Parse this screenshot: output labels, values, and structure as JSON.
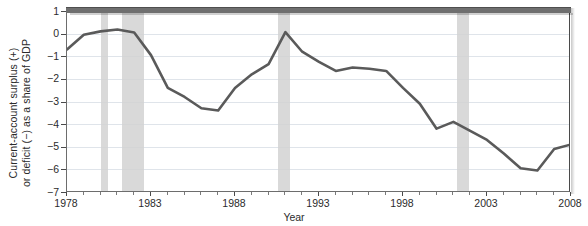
{
  "chart_data": {
    "type": "line",
    "title": "",
    "xlabel": "Year",
    "ylabel_line1": "Current-account surplus (+)",
    "ylabel_line2": "or deficit (−) as a share of GDP",
    "xlim": [
      1978,
      2008
    ],
    "ylim": [
      -7,
      1
    ],
    "ytick_labels": [
      "1",
      "0",
      "−1",
      "−2",
      "−3",
      "−4",
      "−5",
      "−6",
      "−7"
    ],
    "ytick_values": [
      1,
      0,
      -1,
      -2,
      -3,
      -4,
      -5,
      -6,
      -7
    ],
    "xtick_labels": [
      "1978",
      "1983",
      "1988",
      "1993",
      "1998",
      "2003",
      "2008"
    ],
    "xtick_values": [
      1978,
      1983,
      1988,
      1993,
      1998,
      2003,
      2008
    ],
    "grid": "horizontal",
    "legend": "none",
    "line_color": "#5a5a5a",
    "line_width": 2.6,
    "recession_band_color": "#d2d2d2",
    "gridline_color": "#dfe4ea",
    "axis_color": "#4a4a4a",
    "x": [
      1978,
      1979,
      1980,
      1981,
      1982,
      1983,
      1984,
      1985,
      1986,
      1987,
      1988,
      1989,
      1990,
      1991,
      1992,
      1993,
      1994,
      1995,
      1996,
      1997,
      1998,
      1999,
      2000,
      2001,
      2002,
      2003,
      2004,
      2005,
      2006,
      2007,
      2008
    ],
    "values": [
      -0.7,
      -0.05,
      0.1,
      0.18,
      0.05,
      -0.95,
      -2.4,
      -2.8,
      -3.3,
      -3.4,
      -2.4,
      -1.8,
      -1.35,
      0.07,
      -0.8,
      -1.25,
      -1.65,
      -1.5,
      -1.55,
      -1.65,
      -2.4,
      -3.1,
      -4.2,
      -3.9,
      -4.3,
      -4.7,
      -5.3,
      -5.95,
      -6.05,
      -5.1,
      -4.9
    ],
    "recessions": [
      {
        "label": "1980 recession",
        "start": 1980.0,
        "end": 1980.45
      },
      {
        "label": "1981-82 recession",
        "start": 1981.3,
        "end": 1982.6
      },
      {
        "label": "1990-91 recession",
        "start": 1990.55,
        "end": 1991.3
      },
      {
        "label": "2001 recession",
        "start": 2001.2,
        "end": 2001.9
      },
      {
        "label": "2008 recession",
        "start": 2007.9,
        "end": 2008.45
      }
    ]
  }
}
